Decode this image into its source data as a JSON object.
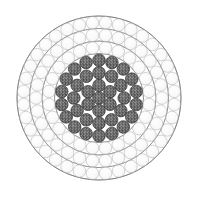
{
  "figure": {
    "caption": "",
    "background_color": "#ffffff",
    "center_x": 99,
    "center_y": 98
  },
  "palette": {
    "core_strand_fill": "#6e6e6e",
    "core_strand_speckle_light": "#8d8d8d",
    "core_strand_speckle_dark": "#4e4e4e",
    "core_strand_stroke": "#3a3a3a",
    "outer_strand_fill": "#fdfdfd",
    "outer_strand_stroke": "#b9b9b9",
    "layer_boundary_stroke": "#8a8a8a",
    "outer_boundary_stroke": "#7d7d7d"
  },
  "chart_data": {
    "type": "scatter",
    "xlabel": "",
    "ylabel": "",
    "xlim": [
      -91,
      91
    ],
    "ylim": [
      -91,
      91
    ],
    "grid": false,
    "legend_position": "none",
    "total_strands": 127,
    "core_strand_count": 37,
    "outer_strand_count": 90,
    "strand_radius": 6.3,
    "layers": [
      {
        "index": 0,
        "name": "center-strand",
        "group": "core",
        "count": 1,
        "ring_radius": 0,
        "angle_offset_deg": 0,
        "fill": "#6e6e6e",
        "stroke": "#3a3a3a"
      },
      {
        "index": 1,
        "name": "core-layer-1",
        "group": "core",
        "count": 6,
        "ring_radius": 12.6,
        "angle_offset_deg": 0,
        "fill": "#6e6e6e",
        "stroke": "#3a3a3a"
      },
      {
        "index": 2,
        "name": "core-layer-2",
        "group": "core",
        "count": 12,
        "ring_radius": 25.2,
        "angle_offset_deg": 0,
        "fill": "#6e6e6e",
        "stroke": "#3a3a3a"
      },
      {
        "index": 3,
        "name": "core-layer-3",
        "group": "core",
        "count": 18,
        "ring_radius": 37.8,
        "angle_offset_deg": 0,
        "fill": "#6e6e6e",
        "stroke": "#3a3a3a"
      },
      {
        "index": 4,
        "name": "outer-layer-1",
        "group": "outer",
        "count": 24,
        "ring_radius": 50.4,
        "angle_offset_deg": 7.5,
        "fill": "#fdfdfd",
        "stroke": "#b9b9b9"
      },
      {
        "index": 5,
        "name": "outer-layer-2",
        "group": "outer",
        "count": 30,
        "ring_radius": 63.0,
        "angle_offset_deg": 6,
        "fill": "#fdfdfd",
        "stroke": "#b9b9b9"
      },
      {
        "index": 6,
        "name": "outer-layer-3",
        "group": "outer",
        "count": 36,
        "ring_radius": 75.6,
        "angle_offset_deg": 5,
        "fill": "#fdfdfd",
        "stroke": "#b9b9b9"
      }
    ],
    "boundaries": [
      {
        "name": "core-boundary",
        "radius": 44.5,
        "stroke": "#8a8a8a",
        "stroke_width": 0.8
      },
      {
        "name": "mid-boundary-1",
        "radius": 57.0,
        "stroke": "#8a8a8a",
        "stroke_width": 0.8
      },
      {
        "name": "mid-boundary-2",
        "radius": 69.5,
        "stroke": "#8a8a8a",
        "stroke_width": 0.8
      },
      {
        "name": "outer-boundary",
        "radius": 82.0,
        "stroke": "#7d7d7d",
        "stroke_width": 0.9
      }
    ]
  }
}
